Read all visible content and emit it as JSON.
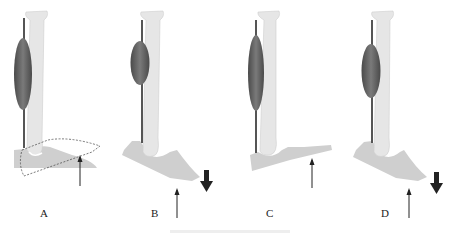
{
  "figure": {
    "panels": [
      {
        "label": "A",
        "description": "neutral foot with dashed displaced outline and upward ground reaction arrow"
      },
      {
        "label": "B",
        "description": "plantarflexed foot with downward force arrow and upward reaction arrow"
      },
      {
        "label": "C",
        "description": "neutral foot with upward ground reaction arrow"
      },
      {
        "label": "D",
        "description": "plantarflexed foot with downward force arrow and upward reaction arrow"
      }
    ],
    "colors": {
      "bone": "#e3e3e3",
      "bone_edge": "#cfcfcf",
      "muscle_dark": "#5a5a5a",
      "muscle_mid": "#7a7a7a",
      "tendon": "#555555",
      "foot": "#cfcfcf",
      "arrow": "#222222"
    }
  }
}
